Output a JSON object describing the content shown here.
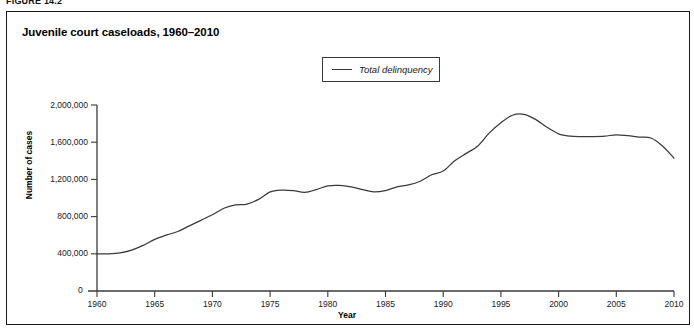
{
  "figure": {
    "label": "FIGURE 14.2",
    "title": "Juvenile court caseloads, 1960–2010"
  },
  "legend": {
    "entries": [
      {
        "label": "Total delinquency",
        "color": "#3a3a3a",
        "style": "line"
      }
    ],
    "position": "top-center"
  },
  "axes": {
    "y": {
      "label": "Number of cases",
      "ticks": [
        "400,000",
        "800,000",
        "1,200,000",
        "1,600,000",
        "2,000,000"
      ],
      "origin_label": "0"
    },
    "x": {
      "label": "Year",
      "ticks": [
        "1960",
        "1965",
        "1970",
        "1975",
        "1980",
        "1985",
        "1990",
        "1995",
        "2000",
        "2005",
        "2010"
      ]
    }
  },
  "chart_data": {
    "type": "line",
    "title": "Juvenile court caseloads, 1960–2010",
    "xlabel": "Year",
    "ylabel": "Number of cases",
    "xlim": [
      1960,
      2010
    ],
    "ylim": [
      0,
      2000000
    ],
    "ytick_values": [
      400000,
      800000,
      1200000,
      1600000,
      2000000
    ],
    "xtick_values": [
      1960,
      1965,
      1970,
      1975,
      1980,
      1985,
      1990,
      1995,
      2000,
      2005,
      2010
    ],
    "grid": false,
    "legend_position": "top-center",
    "series": [
      {
        "name": "Total delinquency",
        "color": "#3a3a3a",
        "x": [
          1960,
          1961,
          1962,
          1963,
          1964,
          1965,
          1966,
          1967,
          1968,
          1969,
          1970,
          1971,
          1972,
          1973,
          1974,
          1975,
          1976,
          1977,
          1978,
          1979,
          1980,
          1981,
          1982,
          1983,
          1984,
          1985,
          1986,
          1987,
          1988,
          1989,
          1990,
          1991,
          1992,
          1993,
          1994,
          1995,
          1996,
          1997,
          1998,
          1999,
          2000,
          2001,
          2002,
          2003,
          2004,
          2005,
          2006,
          2007,
          2008,
          2009,
          2010
        ],
        "values": [
          400000,
          400000,
          410000,
          440000,
          490000,
          555000,
          600000,
          640000,
          700000,
          760000,
          820000,
          890000,
          925000,
          935000,
          985000,
          1065000,
          1085000,
          1080000,
          1060000,
          1090000,
          1130000,
          1135000,
          1120000,
          1090000,
          1065000,
          1080000,
          1120000,
          1140000,
          1180000,
          1250000,
          1290000,
          1400000,
          1480000,
          1560000,
          1700000,
          1810000,
          1890000,
          1900000,
          1845000,
          1760000,
          1690000,
          1665000,
          1660000,
          1660000,
          1665000,
          1680000,
          1670000,
          1655000,
          1645000,
          1560000,
          1430000
        ]
      }
    ]
  }
}
